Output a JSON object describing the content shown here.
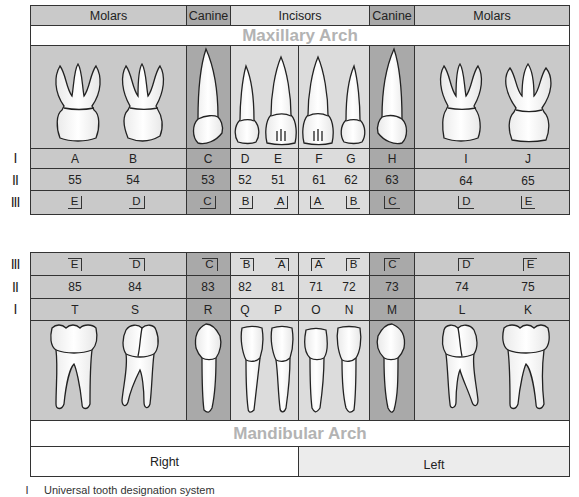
{
  "colors": {
    "molar_bg": "#c9c9c9",
    "canine_bg": "#a9a9a9",
    "incisor_bg": "#dcdcdc",
    "arch_label": "#b3b3b3",
    "left_bg": "#ececec",
    "border": "#333333"
  },
  "row_labels": {
    "universal": "I",
    "fdi": "II",
    "palmer": "III"
  },
  "upper": {
    "groups": [
      {
        "label": "Molars"
      },
      {
        "label": "Canine"
      },
      {
        "label": "Incisors"
      },
      {
        "label": "Canine"
      },
      {
        "label": "Molars"
      }
    ],
    "arch_label": "Maxillary Arch",
    "teeth": [
      {
        "universal": "A",
        "fdi": "55",
        "palmer": "E"
      },
      {
        "universal": "B",
        "fdi": "54",
        "palmer": "D"
      },
      {
        "universal": "C",
        "fdi": "53",
        "palmer": "C"
      },
      {
        "universal": "D",
        "fdi": "52",
        "palmer": "B"
      },
      {
        "universal": "E",
        "fdi": "51",
        "palmer": "A"
      },
      {
        "universal": "F",
        "fdi": "61",
        "palmer": "A"
      },
      {
        "universal": "G",
        "fdi": "62",
        "palmer": "B"
      },
      {
        "universal": "H",
        "fdi": "63",
        "palmer": "C"
      },
      {
        "universal": "I",
        "fdi": "64",
        "palmer": "D"
      },
      {
        "universal": "J",
        "fdi": "65",
        "palmer": "E"
      }
    ]
  },
  "lower": {
    "teeth": [
      {
        "universal": "T",
        "fdi": "85",
        "palmer": "E"
      },
      {
        "universal": "S",
        "fdi": "84",
        "palmer": "D"
      },
      {
        "universal": "R",
        "fdi": "83",
        "palmer": "C"
      },
      {
        "universal": "Q",
        "fdi": "82",
        "palmer": "B"
      },
      {
        "universal": "P",
        "fdi": "81",
        "palmer": "A"
      },
      {
        "universal": "O",
        "fdi": "71",
        "palmer": "A"
      },
      {
        "universal": "N",
        "fdi": "72",
        "palmer": "B"
      },
      {
        "universal": "M",
        "fdi": "73",
        "palmer": "C"
      },
      {
        "universal": "L",
        "fdi": "74",
        "palmer": "D"
      },
      {
        "universal": "K",
        "fdi": "75",
        "palmer": "E"
      }
    ],
    "arch_label": "Mandibular Arch",
    "sides": {
      "right": "Right",
      "left": "Left"
    }
  },
  "legend": [
    {
      "numeral": "I",
      "text": "Universal tooth designation system"
    }
  ]
}
